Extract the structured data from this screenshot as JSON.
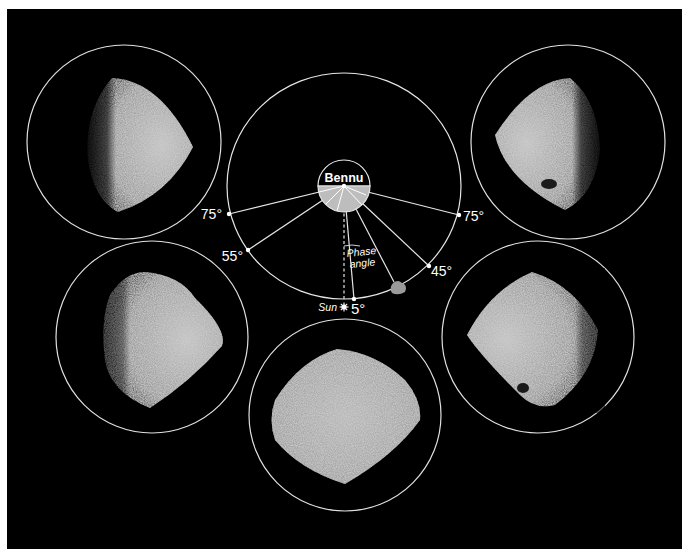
{
  "diagram": {
    "title_label": "Bennu",
    "phase_angle_label_line1": "Phase",
    "phase_angle_label_line2": "angle",
    "sun_label": "Sun",
    "colors": {
      "background": "#000000",
      "frame": "#ffffff",
      "line": "#e6e6e6",
      "bennu_lit": "#bdbdbd",
      "asteroid_surface": "#a8a8a8"
    },
    "angles": [
      {
        "label": "75°",
        "side": "left"
      },
      {
        "label": "55°",
        "side": "left"
      },
      {
        "label": "5°",
        "side": "bottom"
      },
      {
        "label": "45°",
        "side": "right"
      },
      {
        "label": "75°",
        "side": "right"
      }
    ],
    "views": [
      {
        "position": "top-left",
        "phase": "75°",
        "lit_side": "right"
      },
      {
        "position": "middle-left",
        "phase": "55°",
        "lit_side": "right"
      },
      {
        "position": "bottom-center",
        "phase": "5°",
        "lit_side": "full"
      },
      {
        "position": "middle-right",
        "phase": "45°",
        "lit_side": "left"
      },
      {
        "position": "top-right",
        "phase": "75°",
        "lit_side": "left"
      }
    ]
  }
}
